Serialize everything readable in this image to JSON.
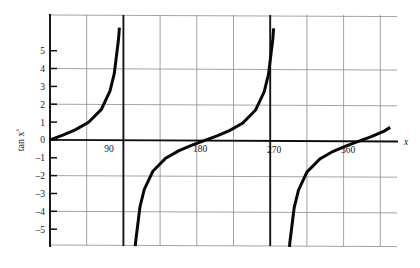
{
  "chart_data": {
    "type": "line",
    "title": "",
    "subtitle": "",
    "xlabel": "x",
    "ylabel": "tan x°",
    "ylabel_base": "tan x",
    "ylabel_sup": "°",
    "xlim": [
      0,
      405
    ],
    "ylim": [
      -5.7,
      6.3
    ],
    "grid": true,
    "grid_x_step": 45,
    "grid_y_step": 2,
    "legend": "none",
    "xticks": [
      90,
      180,
      270,
      360
    ],
    "xticklabels": [
      "90",
      "180",
      "270",
      "360"
    ],
    "yticks": [
      5,
      4,
      3,
      2,
      1,
      0,
      -1,
      -2,
      -3,
      -4,
      -5
    ],
    "yticklabels": [
      "5",
      "4",
      "3",
      "2",
      "1",
      "0",
      "–1",
      "–2",
      "–3",
      "–4",
      "–5"
    ],
    "asymptotes": [
      90,
      270
    ],
    "asymptote_labels": [
      "90",
      "270"
    ],
    "function": "y = tan x°",
    "series": [
      {
        "name": "tan x° branch 1",
        "x_range": [
          0,
          90
        ],
        "points": [
          {
            "x": 0,
            "y": 0
          },
          {
            "x": 15,
            "y": 0.27
          },
          {
            "x": 30,
            "y": 0.58
          },
          {
            "x": 45,
            "y": 1.0
          },
          {
            "x": 60,
            "y": 1.73
          },
          {
            "x": 70,
            "y": 2.75
          },
          {
            "x": 75,
            "y": 3.73
          },
          {
            "x": 80,
            "y": 5.67
          },
          {
            "x": 81,
            "y": 6.31
          }
        ]
      },
      {
        "name": "tan x° branch 2",
        "x_range": [
          90,
          270
        ],
        "points": [
          {
            "x": 99.5,
            "y": -5.93
          },
          {
            "x": 100,
            "y": -5.67
          },
          {
            "x": 105,
            "y": -3.73
          },
          {
            "x": 110,
            "y": -2.75
          },
          {
            "x": 120,
            "y": -1.73
          },
          {
            "x": 135,
            "y": -1.0
          },
          {
            "x": 150,
            "y": -0.58
          },
          {
            "x": 165,
            "y": -0.27
          },
          {
            "x": 180,
            "y": 0
          },
          {
            "x": 195,
            "y": 0.27
          },
          {
            "x": 210,
            "y": 0.58
          },
          {
            "x": 225,
            "y": 1.0
          },
          {
            "x": 240,
            "y": 1.73
          },
          {
            "x": 250,
            "y": 2.75
          },
          {
            "x": 255,
            "y": 3.73
          },
          {
            "x": 260,
            "y": 5.67
          },
          {
            "x": 261,
            "y": 6.31
          }
        ]
      },
      {
        "name": "tan x° branch 3",
        "x_range": [
          270,
          405
        ],
        "points": [
          {
            "x": 279.5,
            "y": -5.93
          },
          {
            "x": 280,
            "y": -5.67
          },
          {
            "x": 285,
            "y": -3.73
          },
          {
            "x": 290,
            "y": -2.75
          },
          {
            "x": 300,
            "y": -1.73
          },
          {
            "x": 315,
            "y": -1.0
          },
          {
            "x": 330,
            "y": -0.58
          },
          {
            "x": 345,
            "y": -0.27
          },
          {
            "x": 360,
            "y": 0
          },
          {
            "x": 375,
            "y": 0.27
          },
          {
            "x": 390,
            "y": 0.58
          },
          {
            "x": 397,
            "y": 0.79
          }
        ]
      }
    ],
    "colors": {
      "curve": "#080808",
      "axis": "#0d0d0d",
      "grid": "#8a8a8a",
      "asymptote": "#141414",
      "background": "#ffffff"
    }
  }
}
